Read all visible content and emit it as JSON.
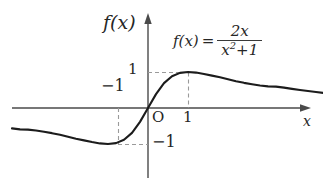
{
  "figure": {
    "background_color": "#ffffff",
    "stroke_color": "#262626",
    "axis_color": "#4a4a4a",
    "dash_color": "#9a9a9a"
  },
  "labels": {
    "y_axis_label": "f(x)",
    "x_axis_label": "x",
    "origin": "O",
    "x_tick_one": "1",
    "x_tick_negative_one": "−1",
    "y_tick_one": "1",
    "y_tick_negative_one": "−1"
  },
  "formula": {
    "lhs": "f(x)",
    "equals": "=",
    "numerator": "2x",
    "denominator_base": "x",
    "denominator_exponent": "2",
    "denominator_plus": "+",
    "denominator_constant": "1",
    "plain": "f(x) = 2x/(x²+1)"
  },
  "chart_data": {
    "type": "line",
    "title": "",
    "subtitle": "",
    "xlabel": "x",
    "ylabel": "f(x)",
    "expression": "f(x) = 2x/(x^2 + 1)",
    "xlim": [
      -3.4,
      4.4
    ],
    "ylim": [
      -2.6,
      2.6
    ],
    "grid": false,
    "legend": null,
    "xticks": [
      -1,
      0,
      1
    ],
    "xticklabels": [
      "−1",
      "O",
      "1"
    ],
    "yticks": [
      -1,
      1
    ],
    "yticklabels": [
      "−1",
      "1"
    ],
    "annotations": [
      {
        "text": "f(x) = 2x/(x²+1)",
        "x": 1.4,
        "y": 2.0,
        "role": "equation-label"
      }
    ],
    "guides": [
      {
        "type": "dashed-horizontal",
        "y": 1,
        "from_x": 0,
        "to_x": 1
      },
      {
        "type": "dashed-vertical",
        "x": 1,
        "from_y": 0,
        "to_y": 1
      },
      {
        "type": "dashed-horizontal",
        "y": -1,
        "from_x": -1,
        "to_x": 0
      },
      {
        "type": "dashed-vertical",
        "x": -1,
        "from_y": -1,
        "to_y": 0
      }
    ],
    "key_points": [
      {
        "label": "maximum",
        "x": 1,
        "y": 1
      },
      {
        "label": "minimum",
        "x": -1,
        "y": -1
      },
      {
        "label": "origin-crossing",
        "x": 0,
        "y": 0
      }
    ],
    "x": [
      -3.4,
      -3.2,
      -3.0,
      -2.8,
      -2.6,
      -2.4,
      -2.2,
      -2.0,
      -1.8,
      -1.6,
      -1.4,
      -1.2,
      -1.0,
      -0.8,
      -0.6,
      -0.4,
      -0.2,
      0.0,
      0.2,
      0.4,
      0.6,
      0.8,
      1.0,
      1.2,
      1.4,
      1.6,
      1.8,
      2.0,
      2.2,
      2.4,
      2.6,
      2.8,
      3.0,
      3.2,
      3.4,
      3.6,
      3.8,
      4.0,
      4.2,
      4.4
    ],
    "values": [
      -0.565,
      -0.593,
      -0.6,
      -0.626,
      -0.661,
      -0.699,
      -0.742,
      -0.8,
      -0.853,
      -0.899,
      -0.946,
      -0.984,
      -1.0,
      -0.976,
      -0.882,
      -0.69,
      -0.385,
      0.0,
      0.385,
      0.69,
      0.882,
      0.976,
      1.0,
      0.984,
      0.946,
      0.899,
      0.853,
      0.8,
      0.742,
      0.699,
      0.661,
      0.626,
      0.6,
      0.593,
      0.565,
      0.532,
      0.502,
      0.471,
      0.443,
      0.418
    ]
  }
}
